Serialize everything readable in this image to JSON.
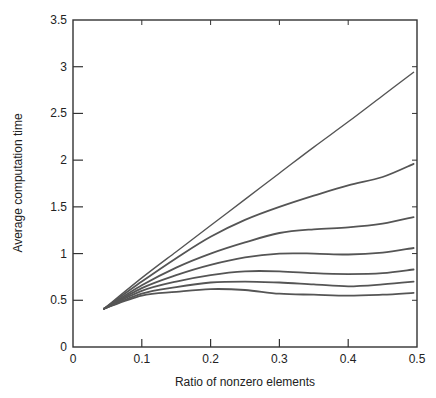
{
  "chart_data": {
    "type": "line",
    "title": "",
    "xlabel": "Ratio of nonzero elements",
    "ylabel": "Average computation time",
    "xlim": [
      0,
      0.5
    ],
    "ylim": [
      0,
      3.5
    ],
    "xticks": [
      0,
      0.1,
      0.2,
      0.3,
      0.4,
      0.5
    ],
    "xtick_labels": [
      "0",
      "0.1",
      "0.2",
      "0.3",
      "0.4",
      "0.5"
    ],
    "yticks": [
      0,
      0.5,
      1,
      1.5,
      2,
      2.5,
      3,
      3.5
    ],
    "ytick_labels": [
      "0",
      "0.5",
      "1",
      "1.5",
      "2",
      "2.5",
      "3",
      "3.5"
    ],
    "grid": false,
    "legend": null,
    "x": [
      0.045,
      0.1,
      0.15,
      0.2,
      0.25,
      0.3,
      0.35,
      0.4,
      0.45,
      0.495
    ],
    "series": [
      {
        "name": "curve-1",
        "values": [
          0.41,
          0.74,
          1.02,
          1.3,
          1.58,
          1.86,
          2.14,
          2.41,
          2.69,
          2.94
        ]
      },
      {
        "name": "curve-2",
        "values": [
          0.41,
          0.7,
          0.95,
          1.18,
          1.36,
          1.5,
          1.62,
          1.73,
          1.82,
          1.96
        ]
      },
      {
        "name": "curve-3",
        "values": [
          0.41,
          0.66,
          0.85,
          1.0,
          1.12,
          1.22,
          1.26,
          1.28,
          1.32,
          1.39
        ]
      },
      {
        "name": "curve-4",
        "values": [
          0.41,
          0.63,
          0.77,
          0.88,
          0.96,
          1.0,
          1.0,
          0.99,
          1.01,
          1.06
        ]
      },
      {
        "name": "curve-5",
        "values": [
          0.41,
          0.6,
          0.7,
          0.77,
          0.81,
          0.81,
          0.79,
          0.78,
          0.79,
          0.83
        ]
      },
      {
        "name": "curve-6",
        "values": [
          0.41,
          0.57,
          0.64,
          0.69,
          0.7,
          0.69,
          0.67,
          0.65,
          0.67,
          0.7
        ]
      },
      {
        "name": "curve-7",
        "values": [
          0.41,
          0.55,
          0.59,
          0.62,
          0.61,
          0.57,
          0.56,
          0.55,
          0.56,
          0.58
        ]
      }
    ],
    "colors": {
      "line": "#555555",
      "axis": "#333333",
      "background": "#ffffff"
    }
  }
}
